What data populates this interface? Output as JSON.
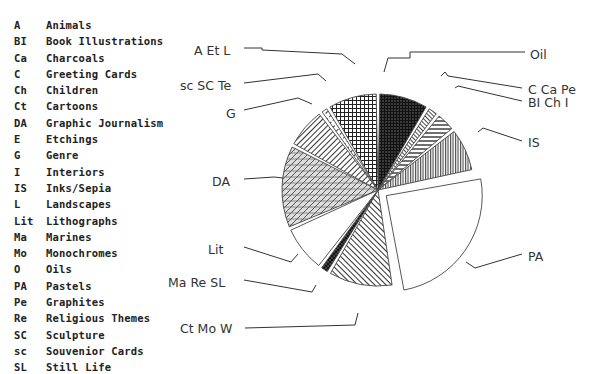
{
  "legend": [
    {
      "code": "A",
      "name": "Animals"
    },
    {
      "code": "BI",
      "name": "Book Illustrations"
    },
    {
      "code": "Ca",
      "name": "Charcoals"
    },
    {
      "code": "C",
      "name": "Greeting Cards"
    },
    {
      "code": "Ch",
      "name": "Children"
    },
    {
      "code": "Ct",
      "name": "Cartoons"
    },
    {
      "code": "DA",
      "name": "Graphic Journalism"
    },
    {
      "code": "E",
      "name": "Etchings"
    },
    {
      "code": "G",
      "name": "Genre"
    },
    {
      "code": "I",
      "name": "Interiors"
    },
    {
      "code": "IS",
      "name": "Inks/Sepia"
    },
    {
      "code": "L",
      "name": "Landscapes"
    },
    {
      "code": "Lit",
      "name": "Lithographs"
    },
    {
      "code": "Ma",
      "name": "Marines"
    },
    {
      "code": "Mo",
      "name": "Monochromes"
    },
    {
      "code": "O",
      "name": "Oils"
    },
    {
      "code": "PA",
      "name": "Pastels"
    },
    {
      "code": "Pe",
      "name": "Graphites"
    },
    {
      "code": "Re",
      "name": "Religious Themes"
    },
    {
      "code": "SC",
      "name": "Sculpture"
    },
    {
      "code": "sc",
      "name": "Souvenior Cards"
    },
    {
      "code": "SL",
      "name": "Still Life"
    }
  ],
  "chart_data": {
    "type": "pie",
    "title": "",
    "start_angle_deg": 0,
    "direction": "clockwise",
    "legend_position": "left",
    "slices": [
      {
        "label": "Oil",
        "value": 8.5,
        "pattern": "dark-grid",
        "exploded": false,
        "label_pos": [
          530,
          55
        ],
        "line": [
          [
            525,
            52
          ],
          [
            410,
            52
          ],
          [
            410,
            58
          ],
          [
            388,
            58
          ],
          [
            384,
            72
          ]
        ]
      },
      {
        "label": "C Ca Pe",
        "value": 2.0,
        "pattern": "diag-fine",
        "exploded": false,
        "label_pos": [
          528,
          90
        ],
        "line": [
          [
            522,
            88
          ],
          [
            448,
            76
          ],
          [
            445,
            72
          ],
          [
            441,
            76
          ]
        ]
      },
      {
        "label": "BI Ch I",
        "value": 3.5,
        "pattern": "horiz",
        "exploded": false,
        "label_pos": [
          528,
          103
        ],
        "line": [
          [
            522,
            101
          ],
          [
            458,
            86
          ],
          [
            455,
            88
          ]
        ]
      },
      {
        "label": "IS",
        "value": 7.5,
        "pattern": "vert",
        "exploded": false,
        "label_pos": [
          528,
          143
        ],
        "line": [
          [
            522,
            141
          ],
          [
            483,
            128
          ],
          [
            478,
            132
          ]
        ]
      },
      {
        "label": "PA",
        "value": 25.0,
        "pattern": "none",
        "exploded": true,
        "label_pos": [
          528,
          257
        ],
        "line": [
          [
            522,
            254
          ],
          [
            475,
            268
          ],
          [
            466,
            262
          ]
        ]
      },
      {
        "label": "Ct Mo W",
        "value": 11.0,
        "pattern": "diag",
        "exploded": false,
        "label_pos": [
          180,
          329
        ],
        "line": [
          [
            245,
            328
          ],
          [
            355,
            325
          ],
          [
            358,
            313
          ]
        ]
      },
      {
        "label": "Ma Re SL",
        "value": 1.7,
        "pattern": "dark-cross",
        "exploded": false,
        "label_pos": [
          168,
          283
        ],
        "line": [
          [
            244,
            280
          ],
          [
            312,
            292
          ],
          [
            316,
            285
          ]
        ]
      },
      {
        "label": "Lit",
        "value": 8.0,
        "pattern": "none",
        "exploded": false,
        "label_pos": [
          208,
          250
        ],
        "line": [
          [
            244,
            247
          ],
          [
            291,
            262
          ],
          [
            298,
            254
          ]
        ]
      },
      {
        "label": "DA",
        "value": 14.0,
        "pattern": "diag-horiz",
        "exploded": false,
        "label_pos": [
          212,
          182
        ],
        "line": [
          [
            244,
            179
          ],
          [
            274,
            177
          ],
          [
            283,
            178
          ]
        ]
      },
      {
        "label": "G",
        "value": 7.0,
        "pattern": "diag-wide",
        "exploded": false,
        "label_pos": [
          226,
          114
        ],
        "line": [
          [
            244,
            110
          ],
          [
            298,
            98
          ],
          [
            312,
            104
          ]
        ]
      },
      {
        "label": "sc SC Te",
        "value": 1.5,
        "pattern": "diag-dash",
        "exploded": false,
        "label_pos": [
          180,
          86
        ],
        "line": [
          [
            244,
            83
          ],
          [
            318,
            74
          ],
          [
            326,
            81
          ]
        ]
      },
      {
        "label": "A Et L",
        "value": 8.5,
        "pattern": "grid",
        "exploded": false,
        "label_pos": [
          194,
          51
        ],
        "line": [
          [
            244,
            48
          ],
          [
            262,
            48
          ],
          [
            262,
            50
          ],
          [
            342,
            54
          ],
          [
            355,
            64
          ]
        ]
      }
    ],
    "center": [
      378,
      190
    ],
    "radius": 96
  }
}
